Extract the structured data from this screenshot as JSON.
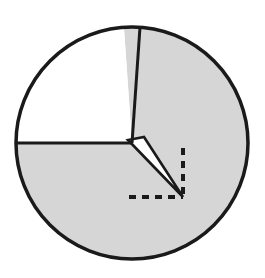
{
  "figure": {
    "background_color": "#ffffff",
    "width": 265,
    "height": 278
  },
  "chart_data": {
    "type": "pie",
    "title": "",
    "subtitle": "",
    "xlabel": "",
    "ylabel": "",
    "legend": [],
    "annotations": [
      {
        "name": "right-angle-marker",
        "kind": "dashed-right-angle",
        "vertex_x": 183,
        "vertex_y": 197,
        "vertical_from_y": 148,
        "horizontal_from_x": 129,
        "dash_pattern": "7 6",
        "color": "#1a1a1a",
        "stroke_width": 4
      }
    ],
    "circle": {
      "center_x": 132,
      "center_y": 143,
      "radius": 116,
      "stroke_color": "#1a1a1a",
      "stroke_width": 3.5
    },
    "categories": [
      "unshaded sector",
      "shaded sector"
    ],
    "values": [
      86,
      274
    ],
    "units": "degrees",
    "slices": [
      {
        "label": "unshaded sector",
        "fill": "#ffffff",
        "start_angle_deg": 94,
        "end_angle_deg": 180,
        "sweep_deg": 86
      },
      {
        "label": "shaded sector",
        "fill": "#d6d6d6",
        "start_angle_deg": 180,
        "end_angle_deg": 94,
        "sweep_deg": 274
      }
    ],
    "radii": [
      {
        "name": "upper-radius",
        "angle_deg": 94,
        "end_x": 140,
        "end_y": 27,
        "stroke_color": "#1a1a1a",
        "stroke_width": 3
      },
      {
        "name": "left-radius",
        "angle_deg": 180,
        "end_x": 16,
        "end_y": 143,
        "stroke_color": "#1a1a1a",
        "stroke_width": 3
      }
    ],
    "wedge": {
      "name": "thin-white-wedge",
      "description": "narrow unshaded wedge from center to lower-right vertex",
      "apex_x": 183,
      "apex_y": 197,
      "base_a_x": 128,
      "base_a_y": 140,
      "base_b_x": 144,
      "base_b_y": 137,
      "fill": "#ffffff",
      "stroke_color": "#1a1a1a",
      "stroke_width": 2.6
    },
    "grid": false,
    "legend_position": "none"
  },
  "colors": {
    "ink": "#1a1a1a",
    "shade": "#d6d6d6",
    "paper": "#ffffff"
  }
}
